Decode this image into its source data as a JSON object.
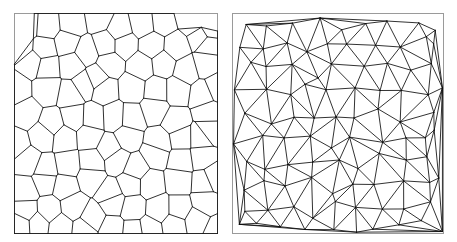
{
  "figure": {
    "type": "diagram",
    "title": "",
    "width": 457,
    "height": 242,
    "background_color": "#ffffff",
    "panel_count": 2
  },
  "panels": [
    {
      "id": "voronoi-panel",
      "name": "Voronoi diagram",
      "label": "",
      "frame": {
        "x": 14,
        "y": 13,
        "width": 203,
        "height": 220
      },
      "frame_color": "#9a9a9a",
      "edge_color": "#1a1a1a",
      "edge_width": 0.9,
      "fill_color": "#ffffff",
      "cell_count": 66,
      "render": "voronoi"
    },
    {
      "id": "delaunay-panel",
      "name": "Delaunay triangulation",
      "label": "",
      "frame": {
        "x": 232,
        "y": 13,
        "width": 211,
        "height": 220
      },
      "frame_color": "#9a9a9a",
      "edge_color": "#0d0d0d",
      "edge_width": 0.85,
      "fill_color": "#ffffff",
      "triangle_count": 118,
      "render": "delaunay"
    }
  ],
  "chart_data": {
    "type": "scatter",
    "title": "",
    "xlabel": "",
    "ylabel": "",
    "xlim": [
      0,
      1
    ],
    "ylim": [
      0,
      1
    ],
    "grid": false,
    "legend": null,
    "note": "Normalized generator sites in unit square; both panels derive from this identical point set.",
    "points": [
      [
        0.048,
        0.041
      ],
      [
        0.171,
        0.036
      ],
      [
        0.286,
        0.05
      ],
      [
        0.404,
        0.03
      ],
      [
        0.512,
        0.055
      ],
      [
        0.621,
        0.033
      ],
      [
        0.742,
        0.046
      ],
      [
        0.862,
        0.03
      ],
      [
        0.957,
        0.052
      ],
      [
        0.031,
        0.139
      ],
      [
        0.126,
        0.152
      ],
      [
        0.232,
        0.128
      ],
      [
        0.33,
        0.158
      ],
      [
        0.447,
        0.132
      ],
      [
        0.556,
        0.16
      ],
      [
        0.668,
        0.135
      ],
      [
        0.783,
        0.152
      ],
      [
        0.902,
        0.128
      ],
      [
        0.972,
        0.163
      ],
      [
        0.062,
        0.243
      ],
      [
        0.164,
        0.262
      ],
      [
        0.275,
        0.235
      ],
      [
        0.382,
        0.268
      ],
      [
        0.486,
        0.24
      ],
      [
        0.598,
        0.265
      ],
      [
        0.712,
        0.238
      ],
      [
        0.828,
        0.258
      ],
      [
        0.94,
        0.244
      ],
      [
        0.036,
        0.352
      ],
      [
        0.143,
        0.338
      ],
      [
        0.253,
        0.366
      ],
      [
        0.361,
        0.344
      ],
      [
        0.468,
        0.372
      ],
      [
        0.58,
        0.34
      ],
      [
        0.69,
        0.368
      ],
      [
        0.806,
        0.345
      ],
      [
        0.918,
        0.36
      ],
      [
        0.986,
        0.338
      ],
      [
        0.054,
        0.462
      ],
      [
        0.158,
        0.478
      ],
      [
        0.268,
        0.45
      ],
      [
        0.372,
        0.482
      ],
      [
        0.48,
        0.455
      ],
      [
        0.592,
        0.478
      ],
      [
        0.706,
        0.448
      ],
      [
        0.82,
        0.472
      ],
      [
        0.93,
        0.458
      ],
      [
        0.028,
        0.572
      ],
      [
        0.136,
        0.556
      ],
      [
        0.246,
        0.584
      ],
      [
        0.356,
        0.56
      ],
      [
        0.464,
        0.588
      ],
      [
        0.576,
        0.558
      ],
      [
        0.688,
        0.582
      ],
      [
        0.8,
        0.562
      ],
      [
        0.912,
        0.578
      ],
      [
        0.978,
        0.554
      ],
      [
        0.058,
        0.676
      ],
      [
        0.166,
        0.692
      ],
      [
        0.272,
        0.664
      ],
      [
        0.38,
        0.694
      ],
      [
        0.49,
        0.668
      ],
      [
        0.602,
        0.69
      ],
      [
        0.714,
        0.662
      ],
      [
        0.826,
        0.686
      ],
      [
        0.938,
        0.67
      ],
      [
        0.034,
        0.786
      ],
      [
        0.14,
        0.77
      ],
      [
        0.25,
        0.796
      ],
      [
        0.358,
        0.772
      ],
      [
        0.47,
        0.798
      ],
      [
        0.582,
        0.768
      ],
      [
        0.694,
        0.792
      ],
      [
        0.808,
        0.774
      ],
      [
        0.92,
        0.79
      ],
      [
        0.982,
        0.766
      ],
      [
        0.052,
        0.888
      ],
      [
        0.16,
        0.902
      ],
      [
        0.266,
        0.876
      ],
      [
        0.374,
        0.906
      ],
      [
        0.484,
        0.88
      ],
      [
        0.596,
        0.9
      ],
      [
        0.708,
        0.874
      ],
      [
        0.822,
        0.896
      ],
      [
        0.932,
        0.882
      ],
      [
        0.03,
        0.962
      ],
      [
        0.138,
        0.975
      ],
      [
        0.248,
        0.958
      ],
      [
        0.358,
        0.978
      ],
      [
        0.466,
        0.956
      ],
      [
        0.578,
        0.974
      ],
      [
        0.69,
        0.954
      ],
      [
        0.804,
        0.972
      ],
      [
        0.916,
        0.958
      ],
      [
        0.988,
        0.976
      ]
    ]
  }
}
